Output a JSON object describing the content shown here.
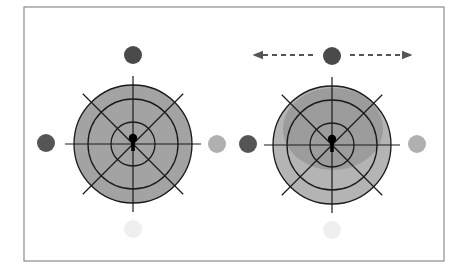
{
  "canvas": {
    "width": 465,
    "height": 277,
    "background": "#ffffff"
  },
  "frame": {
    "x": 24,
    "y": 7,
    "width": 420,
    "height": 254,
    "stroke": "#8a8a8a",
    "stroke_width": 1.2
  },
  "colors": {
    "line": "#1a1a1a",
    "fill_left": "#a3a3a3",
    "fill_right_outer": "#b4b4b4",
    "fill_right_inner": "#9a9a9a",
    "keyhole": "#000000",
    "arrow": "#555555"
  },
  "targets": [
    {
      "id": "left-target",
      "cx": 133,
      "cy": 144,
      "rings": [
        59,
        45,
        22
      ],
      "axis_half": 68,
      "diag_half": 71,
      "fill": "#a3a3a3",
      "inner_blob": null,
      "dots": [
        {
          "pos": "top",
          "cx": 133,
          "cy": 55,
          "r": 9,
          "color": "#4a4a4a"
        },
        {
          "pos": "left",
          "cx": 46,
          "cy": 143,
          "r": 9,
          "color": "#555555"
        },
        {
          "pos": "right",
          "cx": 217,
          "cy": 144,
          "r": 9,
          "color": "#b0b0b0"
        },
        {
          "pos": "bottom",
          "cx": 133,
          "cy": 229,
          "r": 9,
          "color": "#efefef"
        }
      ],
      "arrows": null
    },
    {
      "id": "right-target",
      "cx": 332,
      "cy": 145,
      "rings": [
        59,
        45,
        22
      ],
      "axis_half": 68,
      "diag_half": 71,
      "fill": "#b4b4b4",
      "inner_blob": {
        "cx": 333,
        "cy": 129,
        "rx": 50,
        "ry": 41,
        "color": "#9c9c9c"
      },
      "dots": [
        {
          "pos": "top",
          "cx": 332,
          "cy": 56,
          "r": 9,
          "color": "#4a4a4a"
        },
        {
          "pos": "left",
          "cx": 248,
          "cy": 144,
          "r": 9,
          "color": "#555555"
        },
        {
          "pos": "right",
          "cx": 417,
          "cy": 144,
          "r": 9,
          "color": "#b0b0b0"
        },
        {
          "pos": "bottom",
          "cx": 332,
          "cy": 230,
          "r": 9,
          "color": "#efefef"
        }
      ],
      "arrows": {
        "y": 55,
        "left": {
          "from": 313,
          "to": 258
        },
        "right": {
          "from": 350,
          "to": 407
        },
        "dash": "5,4",
        "color": "#555555"
      }
    }
  ]
}
